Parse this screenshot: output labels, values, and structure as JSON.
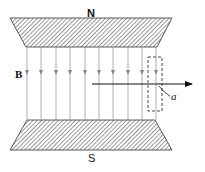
{
  "diagram": {
    "north_label": "N",
    "south_label": "S",
    "field_label": "B",
    "region_label": "a",
    "field_line_xs": [
      27,
      41,
      56,
      70,
      85,
      99,
      113,
      128,
      142,
      156
    ],
    "colors": {
      "pole_fill": "#6a6a6a",
      "field_line": "#9a9a9a",
      "ink": "#111111"
    }
  }
}
